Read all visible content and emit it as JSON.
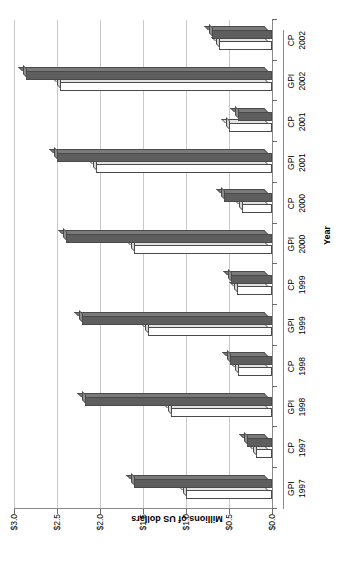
{
  "chart_data": {
    "type": "bar",
    "title": "",
    "xlabel": "Year",
    "ylabel": "Millions of US dollars",
    "ylim": [
      0.0,
      3.0
    ],
    "ytick_labels": [
      "$0.0",
      "$0.5",
      "$1.0",
      "$1.5",
      "$2.0",
      "$2.5",
      "$3.0"
    ],
    "ytick_values": [
      0.0,
      0.5,
      1.0,
      1.5,
      2.0,
      2.5,
      3.0
    ],
    "grid": true,
    "legend": "none",
    "orientation": "rotated-90",
    "categories": [
      {
        "line1": "GPI",
        "line2": "1997"
      },
      {
        "line1": "CP",
        "line2": "1997"
      },
      {
        "line1": "GPI",
        "line2": "1998"
      },
      {
        "line1": "CP",
        "line2": "1998"
      },
      {
        "line1": "GPI",
        "line2": "1999"
      },
      {
        "line1": "CP",
        "line2": "1999"
      },
      {
        "line1": "GPI",
        "line2": "2000"
      },
      {
        "line1": "CP",
        "line2": "2000"
      },
      {
        "line1": "GPI",
        "line2": "2001"
      },
      {
        "line1": "CP",
        "line2": "2001"
      },
      {
        "line1": "GPI",
        "line2": "2002"
      },
      {
        "line1": "CP",
        "line2": "2002"
      }
    ],
    "series": [
      {
        "name": "light",
        "color": "#ffffff",
        "values": [
          1.0,
          0.19,
          1.17,
          0.4,
          1.44,
          0.41,
          1.6,
          0.35,
          2.05,
          0.5,
          2.47,
          0.62
        ]
      },
      {
        "name": "dark",
        "color": "#5e5e5e",
        "values": [
          1.61,
          0.29,
          2.17,
          0.49,
          2.21,
          0.48,
          2.39,
          0.56,
          2.5,
          0.4,
          2.86,
          0.7
        ]
      }
    ]
  }
}
